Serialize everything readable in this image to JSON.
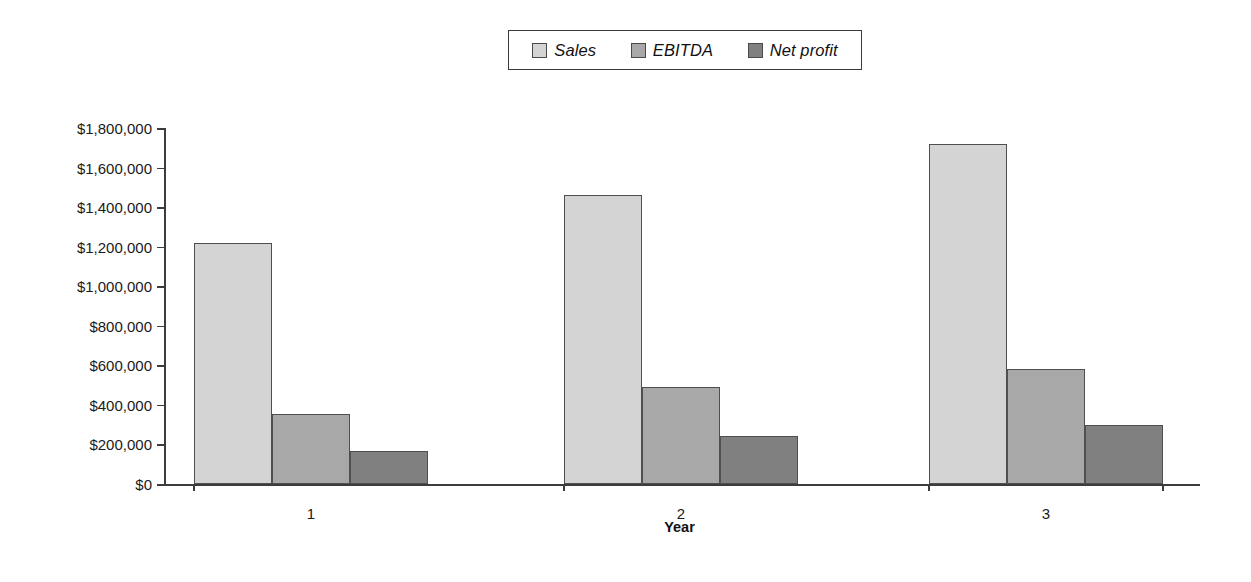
{
  "chart_data": {
    "type": "bar",
    "title": "",
    "subtitle": "",
    "xlabel": "Year",
    "ylabel": "",
    "categories": [
      "1",
      "2",
      "3"
    ],
    "series": [
      {
        "name": "Sales",
        "color": "#d4d4d4",
        "values": [
          1220000,
          1460000,
          1720000
        ]
      },
      {
        "name": "EBITDA",
        "color": "#a8a8a8",
        "values": [
          355000,
          490000,
          580000
        ]
      },
      {
        "name": "Net profit",
        "color": "#808080",
        "values": [
          165000,
          245000,
          298000
        ]
      }
    ],
    "ylim": [
      0,
      1800000
    ],
    "ytick_values": [
      0,
      200000,
      400000,
      600000,
      800000,
      1000000,
      1200000,
      1400000,
      1600000,
      1800000
    ],
    "ytick_labels": [
      "$0",
      "$200,000",
      "$400,000",
      "$600,000",
      "$800,000",
      "$1,000,000",
      "$1,200,000",
      "$1,400,000",
      "$1,600,000",
      "$1,800,000"
    ],
    "grid": false,
    "legend_position": "top-center",
    "legend_border_color": "#3a3a3a",
    "axis_color": "#3c3c3c",
    "bar_border_color": "#4f4f4f",
    "background": "#ffffff"
  },
  "legend": {
    "entries": [
      {
        "label": "Sales",
        "swatch": "legend-swatch-sales"
      },
      {
        "label": "EBITDA",
        "swatch": "legend-swatch-ebitda"
      },
      {
        "label": "Net profit",
        "swatch": "legend-swatch-net-profit"
      }
    ]
  },
  "axes": {
    "x_title": "Year",
    "category_labels": [
      "1",
      "2",
      "3"
    ],
    "y_tick_labels": [
      "$1,800,000",
      "$1,600,000",
      "$1,400,000",
      "$1,200,000",
      "$1,000,000",
      "$800,000",
      "$600,000",
      "$400,000",
      "$200,000",
      "$0"
    ]
  }
}
